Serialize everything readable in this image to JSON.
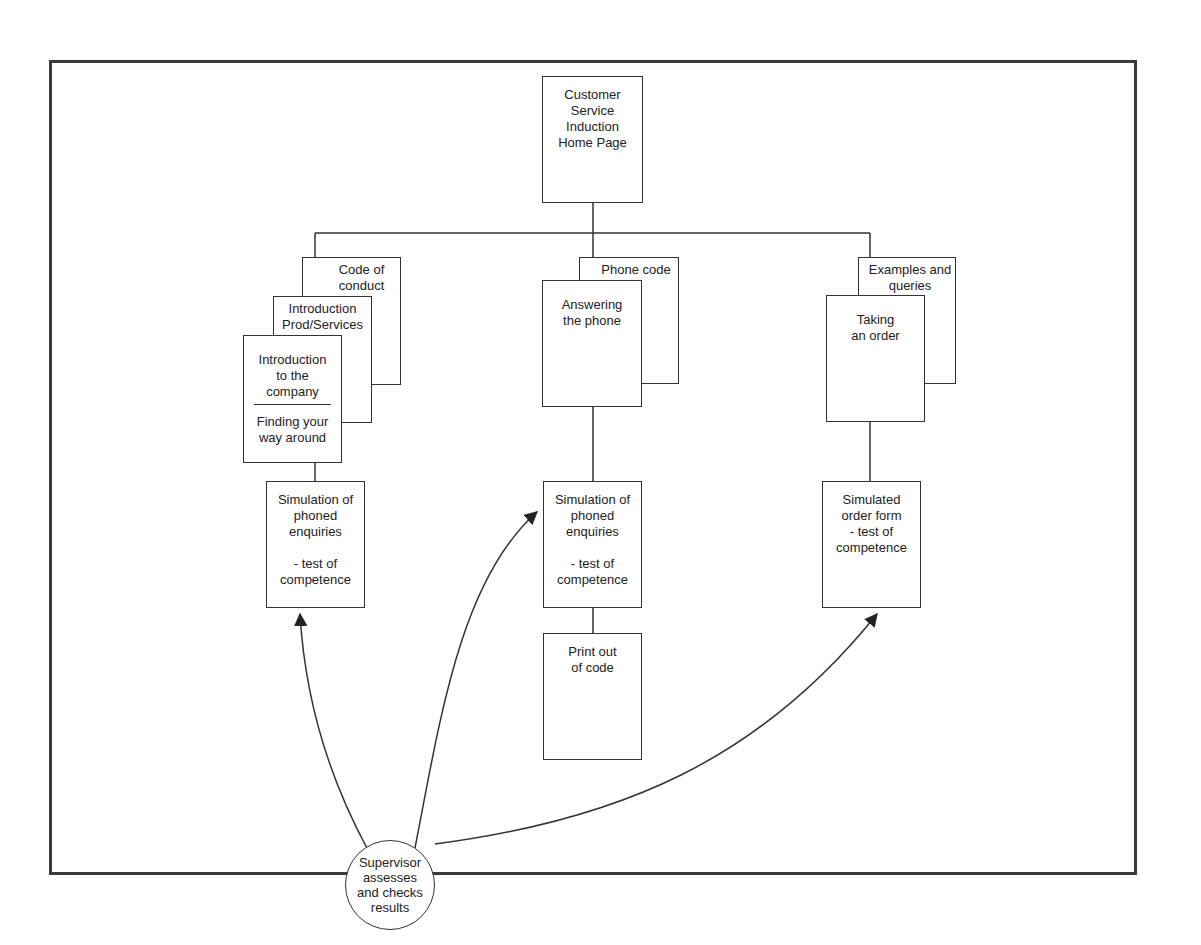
{
  "diagram": {
    "root": {
      "label": "Customer\nService\nInduction\nHome Page"
    },
    "branches": {
      "left": {
        "back": {
          "label": "Code of\nconduct"
        },
        "middle": {
          "label": "Introduction\nProd/Services"
        },
        "front": {
          "top_label": "Introduction\nto the\ncompany",
          "bottom_label": "Finding your\nway around"
        },
        "test": {
          "label": "Simulation of\nphoned\nenquiries\n\n- test of\ncompetence"
        }
      },
      "center": {
        "back": {
          "label": "Phone code"
        },
        "front": {
          "label": "Answering\nthe phone"
        },
        "test": {
          "label": "Simulation of\nphoned\nenquiries\n\n- test of\ncompetence"
        },
        "printout": {
          "label": "Print out\nof code"
        }
      },
      "right": {
        "back": {
          "label": "Examples and\nqueries"
        },
        "front": {
          "label": "Taking\nan order"
        },
        "test": {
          "label": "Simulated\norder form\n- test of\ncompetence"
        }
      }
    },
    "supervisor": {
      "label": "Supervisor\nassesses\nand checks\nresults"
    },
    "colors": {
      "line": "#333333",
      "frame": "#3a3a3a",
      "background": "#ffffff"
    }
  }
}
